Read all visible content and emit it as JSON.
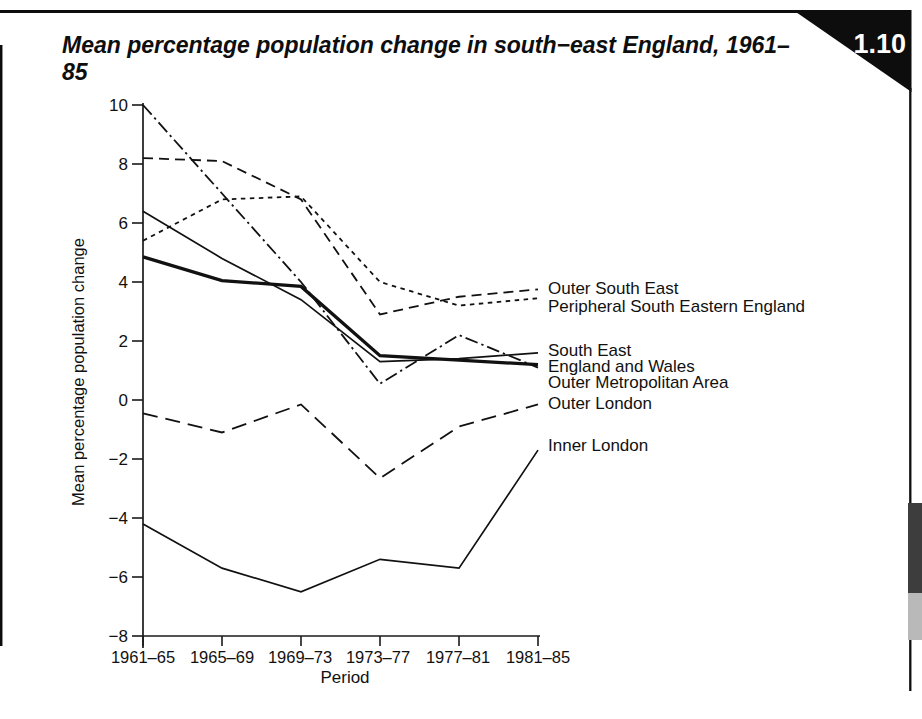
{
  "page": {
    "figure_number": "1.10",
    "title": "Mean percentage population change in south-east England, 1961–85"
  },
  "chart_data": {
    "type": "line",
    "title": "Mean percentage population change in south-east England, 1961–85",
    "xlabel": "Period",
    "ylabel": "Mean percentage population change",
    "ylim": [
      -8,
      10
    ],
    "y_ticks": [
      10,
      8,
      6,
      4,
      2,
      0,
      -2,
      -4,
      -6,
      -8
    ],
    "grid": false,
    "legend_position": "right-of-line-ends",
    "line_color": "#111111",
    "categories": [
      "1961–65",
      "1965–69",
      "1969–73",
      "1973–77",
      "1977–81",
      "1981–85"
    ],
    "series": [
      {
        "name": "Outer South East",
        "style": "dashed",
        "values": [
          8.2,
          8.1,
          6.8,
          2.9,
          3.5,
          3.75
        ]
      },
      {
        "name": "Peripheral South Eastern England",
        "style": "short-dash",
        "values": [
          5.4,
          6.8,
          6.9,
          4.0,
          3.2,
          3.45
        ]
      },
      {
        "name": "South East",
        "style": "solid-thin",
        "values": [
          6.4,
          4.8,
          3.4,
          1.3,
          1.4,
          1.6
        ]
      },
      {
        "name": "England and Wales",
        "style": "solid-thick",
        "values": [
          4.85,
          4.05,
          3.85,
          1.5,
          1.35,
          1.2
        ]
      },
      {
        "name": "Outer Metropolitan Area",
        "style": "dash-dot",
        "values": [
          10.0,
          7.0,
          4.0,
          0.55,
          2.2,
          1.1
        ]
      },
      {
        "name": "Outer London",
        "style": "long-dash",
        "values": [
          -0.45,
          -1.1,
          -0.15,
          -2.65,
          -0.9,
          -0.15
        ]
      },
      {
        "name": "Inner London",
        "style": "solid-thin",
        "values": [
          -4.2,
          -5.7,
          -6.5,
          -5.4,
          -5.7,
          -1.7
        ]
      }
    ]
  }
}
